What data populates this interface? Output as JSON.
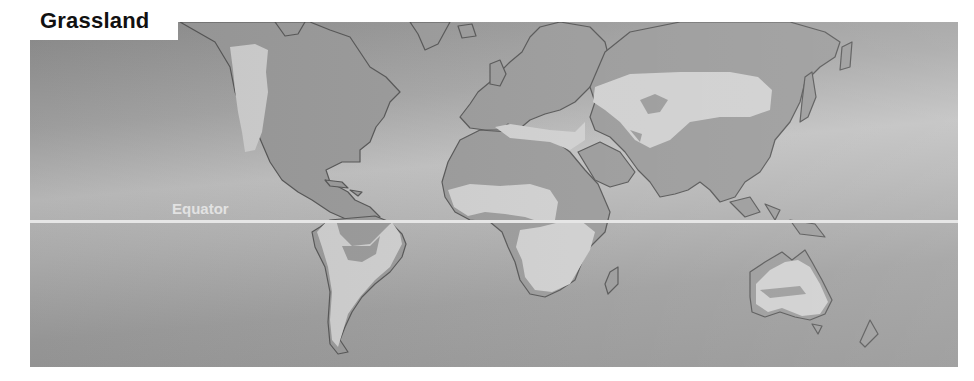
{
  "title": "Grassland",
  "labels": {
    "equator": "Equator"
  },
  "legend": {
    "grassland_color": "#cfcfcf",
    "land_color": "#9a9a9a",
    "coastline_color": "#555555",
    "ocean_color": "#a8a8a8",
    "equator_color": "#e6e6e6"
  },
  "regions_highlighted": [
    "North American Great Plains (prairie)",
    "South American pampas and savanna",
    "African Sahel and savanna",
    "Central Asian steppe",
    "Australian grasslands"
  ]
}
